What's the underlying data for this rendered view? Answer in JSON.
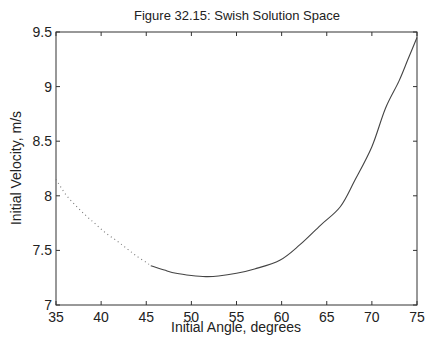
{
  "chart_data": {
    "type": "line",
    "title": "Figure 32.15: Swish Solution Space",
    "xlabel": "Initial Angle, degrees",
    "ylabel": "Initial Velocity, m/s",
    "xlim": [
      35,
      75
    ],
    "ylim": [
      7,
      9.5
    ],
    "xticks": [
      "35",
      "40",
      "45",
      "50",
      "55",
      "60",
      "65",
      "70",
      "75"
    ],
    "yticks": [
      "7",
      "7.5",
      "8",
      "8.5",
      "9",
      "9.5"
    ],
    "grid": false,
    "legend": "none",
    "series": [
      {
        "name": "dotted-branch",
        "style": "dotted",
        "x": [
          35.0,
          36.1,
          37.2,
          38.3,
          39.4,
          40.5,
          41.7,
          42.8,
          43.9,
          45.0,
          45.5
        ],
        "y": [
          8.15,
          8.01,
          7.91,
          7.82,
          7.74,
          7.66,
          7.59,
          7.52,
          7.45,
          7.39,
          7.36
        ]
      },
      {
        "name": "solid-branch",
        "style": "solid",
        "x": [
          45.5,
          47.0,
          48.3,
          50.0,
          51.6,
          53.0,
          55.0,
          57.0,
          59.8,
          62.0,
          64.3,
          66.5,
          68.1,
          70.0,
          71.5,
          73.0,
          74.0,
          75.0
        ],
        "y": [
          7.36,
          7.32,
          7.29,
          7.27,
          7.26,
          7.265,
          7.29,
          7.33,
          7.41,
          7.55,
          7.73,
          7.9,
          8.14,
          8.45,
          8.8,
          9.05,
          9.25,
          9.45
        ]
      }
    ]
  }
}
